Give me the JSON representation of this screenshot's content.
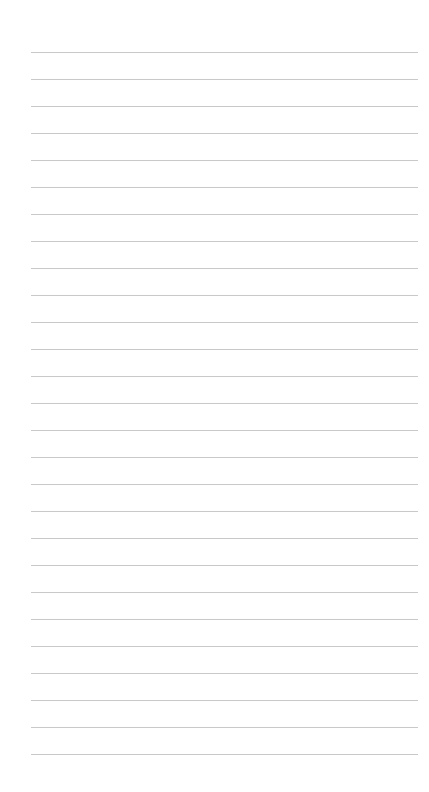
{
  "page": {
    "type": "lined-notepad",
    "line_count": 27,
    "first_line_y": 52,
    "line_spacing": 27,
    "line_left": 31,
    "line_right": 418,
    "line_color": "#c9c9c9",
    "background_color": "#ffffff",
    "text_lines": [
      "",
      "",
      "",
      "",
      "",
      "",
      "",
      "",
      "",
      "",
      "",
      "",
      "",
      "",
      "",
      "",
      "",
      "",
      "",
      "",
      "",
      "",
      "",
      "",
      "",
      "",
      ""
    ]
  }
}
